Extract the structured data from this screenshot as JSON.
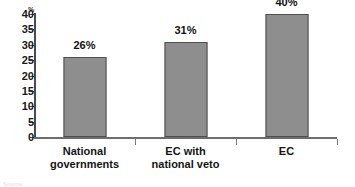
{
  "chart_data": {
    "type": "bar",
    "title": "",
    "subtitle": "",
    "xlabel": "",
    "ylabel": "%",
    "axis_unit": "%",
    "categories": [
      "National governments",
      "EC with national veto",
      "EC"
    ],
    "category_lines": [
      [
        "National",
        "governments"
      ],
      [
        "EC with",
        "national veto"
      ],
      [
        "EC"
      ]
    ],
    "values": [
      26,
      31,
      40
    ],
    "data_labels": [
      "26%",
      "31%",
      "40%"
    ],
    "ylim": [
      0,
      40
    ],
    "ytick_values": [
      0,
      5,
      10,
      15,
      20,
      25,
      30,
      35,
      40
    ],
    "ytick_labels": [
      "0",
      "5",
      "10",
      "15",
      "20",
      "25",
      "30",
      "35",
      "40"
    ],
    "grid": false,
    "legend": false,
    "legend_position": "none",
    "bar_fill_color": "#8e8e8e",
    "bar_border_color": "#4f4f4f",
    "axis_color": "#4a4a4a",
    "text_color": "#151515",
    "background_color": "#ffffff"
  },
  "footer": {
    "source_caption": "Source:"
  }
}
